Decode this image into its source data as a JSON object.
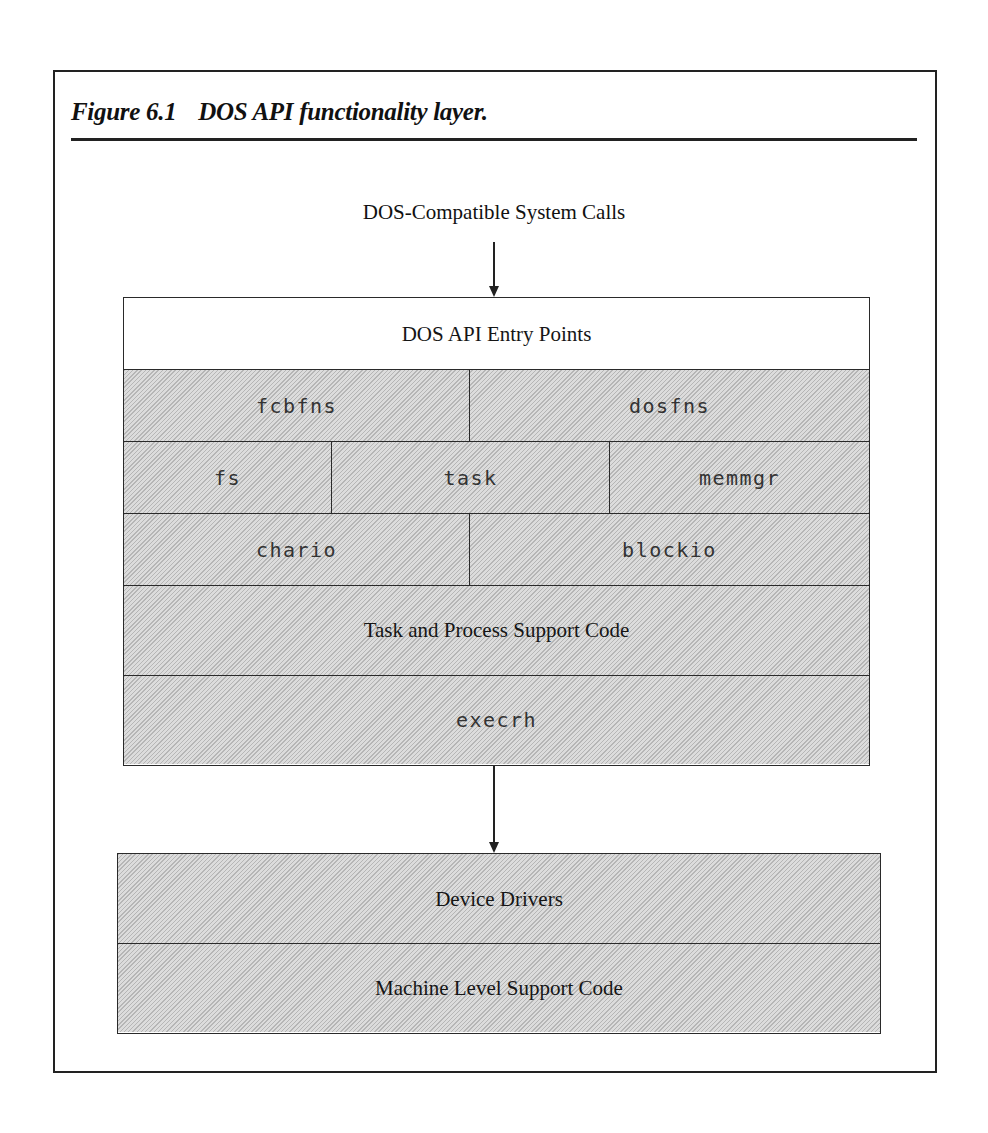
{
  "figure": {
    "number": "Figure 6.1",
    "caption": "DOS API functionality layer."
  },
  "diagram": {
    "input_label": "DOS-Compatible System Calls",
    "upper_stack": {
      "entry_points": "DOS API Entry Points",
      "row1": [
        "fcbfns",
        "dosfns"
      ],
      "row2": [
        "fs",
        "task",
        "memmgr"
      ],
      "row3": [
        "chario",
        "blockio"
      ],
      "support": "Task and Process Support Code",
      "handler": "execrh"
    },
    "lower_stack": {
      "drivers": "Device Drivers",
      "machine": "Machine Level Support Code"
    },
    "edges": [
      {
        "from": "DOS-Compatible System Calls",
        "to": "DOS API Entry Points"
      },
      {
        "from": "execrh",
        "to": "Device Drivers"
      }
    ]
  }
}
